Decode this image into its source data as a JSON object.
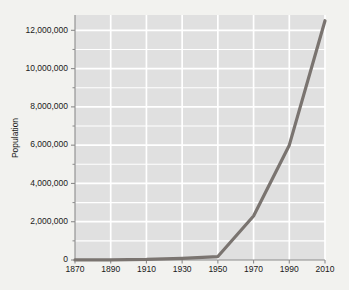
{
  "chart_data": {
    "type": "line",
    "title": "",
    "subtitle": "",
    "xlabel": "",
    "ylabel": "Population",
    "x": [
      1870,
      1890,
      1910,
      1930,
      1950,
      1970,
      1990,
      2010
    ],
    "values": [
      1500,
      11000,
      30000,
      90000,
      180000,
      2300000,
      6000000,
      12500000
    ],
    "series": [
      {
        "name": "Population",
        "values": [
          1500,
          11000,
          30000,
          90000,
          180000,
          2300000,
          6000000,
          12500000
        ]
      }
    ],
    "xlim": [
      1870,
      2010
    ],
    "ylim": [
      0,
      12800000
    ],
    "grid": true,
    "legend": false,
    "legend_position": "none",
    "xticklabels": [
      "1870",
      "1890",
      "1910",
      "1930",
      "1950",
      "1970",
      "1990",
      "2010"
    ],
    "xtickvalues": [
      1870,
      1890,
      1910,
      1930,
      1950,
      1970,
      1990,
      2010
    ],
    "yticklabels": [
      "0",
      "2,000,000",
      "4,000,000",
      "6,000,000",
      "8,000,000",
      "10,000,000",
      "12,000,000"
    ],
    "ytickvalues": [
      0,
      2000000,
      4000000,
      6000000,
      8000000,
      10000000,
      12000000
    ],
    "yminorvalues": [
      1000000,
      3000000,
      5000000,
      7000000,
      9000000,
      11000000
    ],
    "colors": {
      "line": "#7a7470",
      "plot_background": "#e0e0e0",
      "page_background": "#f2f2ef",
      "gridline": "#ffffff",
      "axis": "#8c8c8c",
      "text": "#1a1a1a"
    },
    "line_width": 3.2,
    "marker": "none"
  }
}
